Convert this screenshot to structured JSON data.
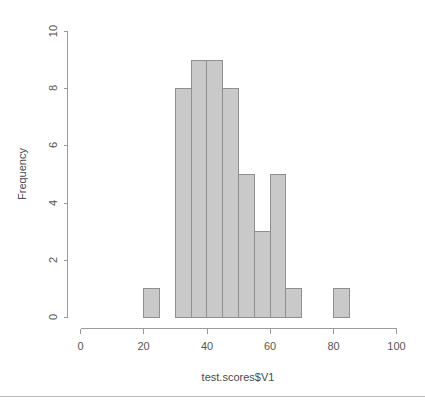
{
  "chart_data": {
    "type": "bar",
    "title": "",
    "subtitle": "",
    "xlabel": "test.scores$V1",
    "ylabel": "Frequency",
    "xlim": [
      0,
      100
    ],
    "ylim": [
      0,
      10
    ],
    "grid": false,
    "legend": null,
    "bin_width": 5,
    "bin_edges": [
      20,
      25,
      30,
      35,
      40,
      45,
      50,
      55,
      60,
      65,
      70,
      75,
      80,
      85
    ],
    "categories": [
      "20-25",
      "25-30",
      "30-35",
      "35-40",
      "40-45",
      "45-50",
      "50-55",
      "55-60",
      "60-65",
      "65-70",
      "70-75",
      "75-80",
      "80-85"
    ],
    "values": [
      1,
      0,
      8,
      9,
      9,
      8,
      5,
      3,
      5,
      1,
      0,
      0,
      1
    ],
    "bars": [
      {
        "x0": 20,
        "x1": 25,
        "value": 1
      },
      {
        "x0": 30,
        "x1": 35,
        "value": 8
      },
      {
        "x0": 35,
        "x1": 40,
        "value": 9
      },
      {
        "x0": 40,
        "x1": 45,
        "value": 9
      },
      {
        "x0": 45,
        "x1": 50,
        "value": 8
      },
      {
        "x0": 50,
        "x1": 55,
        "value": 5
      },
      {
        "x0": 55,
        "x1": 60,
        "value": 3
      },
      {
        "x0": 60,
        "x1": 65,
        "value": 5
      },
      {
        "x0": 65,
        "x1": 70,
        "value": 1
      },
      {
        "x0": 80,
        "x1": 85,
        "value": 1
      }
    ],
    "x_ticks": [
      0,
      20,
      40,
      60,
      80,
      100
    ],
    "x_tick_labels": [
      "0",
      "20",
      "40",
      "60",
      "80",
      "100"
    ],
    "y_ticks": [
      0,
      2,
      4,
      6,
      8,
      10
    ],
    "y_tick_labels": [
      "0",
      "2",
      "4",
      "6",
      "8",
      "10"
    ],
    "colors": {
      "bar_fill": "#c9c9c9",
      "bar_stroke": "#8f8f8f",
      "axis": "#9a9a9a",
      "text": "#555555",
      "background": "#ffffff"
    }
  }
}
